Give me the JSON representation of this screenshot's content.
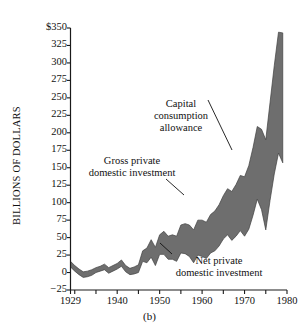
{
  "caption": "(b)",
  "axes": {
    "ylabel": "BILLIONS OF DOLLARS",
    "ytick_labels": [
      "$350",
      "325",
      "300",
      "275",
      "250",
      "225",
      "200",
      "175",
      "150",
      "125",
      "100",
      "75",
      "50",
      "25",
      "0",
      "−25"
    ],
    "xtick_labels": [
      "1929",
      "1940",
      "1950",
      "1960",
      "1970",
      "1980"
    ]
  },
  "annotations": {
    "capital": {
      "line1": "Capital",
      "line2": "consumption",
      "line3": "allowance"
    },
    "gross": {
      "line1": "Gross private",
      "line2": "domestic investment"
    },
    "net": {
      "line1": "Net private",
      "line2": "domestic investment"
    }
  },
  "colors": {
    "band_fill": "#6e6e6e",
    "axis": "#1a1a1a",
    "text": "#111111",
    "background": "#ffffff"
  },
  "chart_data": {
    "type": "area",
    "title": "",
    "subtitle": "",
    "xlabel": "",
    "ylabel": "BILLIONS OF DOLLARS",
    "xlim": [
      1929,
      1980
    ],
    "ylim": [
      -25,
      350
    ],
    "ytick_values": [
      350,
      325,
      300,
      275,
      250,
      225,
      200,
      175,
      150,
      125,
      100,
      75,
      50,
      25,
      0,
      -25
    ],
    "xtick_values": [
      1929,
      1940,
      1950,
      1960,
      1970,
      1980
    ],
    "xtick_minor_step": 5,
    "grid": false,
    "legend": "annotations",
    "band_label": "Capital consumption allowance",
    "x": [
      1929,
      1930,
      1931,
      1932,
      1933,
      1934,
      1935,
      1936,
      1937,
      1938,
      1939,
      1940,
      1941,
      1942,
      1943,
      1944,
      1945,
      1946,
      1947,
      1948,
      1949,
      1950,
      1951,
      1952,
      1953,
      1954,
      1955,
      1956,
      1957,
      1958,
      1959,
      1960,
      1961,
      1962,
      1963,
      1964,
      1965,
      1966,
      1967,
      1968,
      1969,
      1970,
      1971,
      1972,
      1973,
      1974,
      1975,
      1976,
      1977,
      1978,
      1979
    ],
    "series": [
      {
        "name": "Gross private domestic investment",
        "values": [
          16,
          10,
          5,
          1,
          2,
          4,
          7,
          9,
          12,
          7,
          10,
          13,
          18,
          10,
          6,
          8,
          11,
          31,
          35,
          47,
          36,
          54,
          59,
          52,
          54,
          52,
          68,
          70,
          68,
          61,
          75,
          75,
          72,
          83,
          88,
          97,
          110,
          120,
          116,
          126,
          139,
          137,
          153,
          179,
          209,
          205,
          190,
          243,
          296,
          344,
          343
        ]
      },
      {
        "name": "Net private domestic investment",
        "values": [
          8,
          2,
          -3,
          -7,
          -6,
          -4,
          0,
          2,
          4,
          -1,
          2,
          5,
          9,
          1,
          -3,
          -2,
          0,
          16,
          14,
          22,
          10,
          26,
          26,
          19,
          19,
          16,
          28,
          27,
          23,
          14,
          25,
          23,
          20,
          28,
          31,
          38,
          48,
          54,
          46,
          52,
          60,
          52,
          62,
          82,
          105,
          90,
          61,
          103,
          141,
          171,
          157
        ]
      }
    ]
  }
}
